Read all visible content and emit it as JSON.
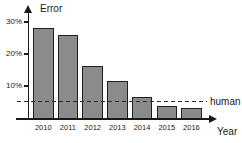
{
  "chart_data": {
    "type": "bar",
    "title": "",
    "y_axis_label": "Error",
    "x_axis_label": "Year",
    "categories": [
      "2010",
      "2011",
      "2012",
      "2013",
      "2014",
      "2015",
      "2016"
    ],
    "values": [
      28.2,
      25.8,
      16.4,
      11.7,
      6.7,
      3.6,
      3.0
    ],
    "y_ticks": [
      {
        "label": "10%",
        "value": 10
      },
      {
        "label": "20%",
        "value": 20
      },
      {
        "label": "30%",
        "value": 30
      }
    ],
    "ylim": [
      0,
      33
    ],
    "grid": false,
    "legend_position": "none",
    "reference_line": {
      "label": "human",
      "value": 5.1,
      "style": "dashed"
    },
    "colors": {
      "bar_fill": "#8b8b8b",
      "bar_border": "#1f1f1f",
      "axis": "#1a1a1a",
      "background": "#ffffff"
    }
  }
}
